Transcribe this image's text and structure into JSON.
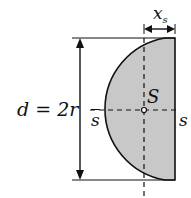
{
  "diagram": {
    "labels": {
      "diameter": "d = 2r",
      "centroid": "S",
      "axis_left": "s",
      "axis_right": "s",
      "offset": "x",
      "offset_sub": "s"
    },
    "colors": {
      "fill": "#c8c8c8",
      "stroke": "#111111"
    }
  }
}
